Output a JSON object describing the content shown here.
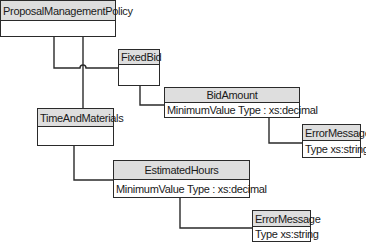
{
  "diagram": {
    "nodes": {
      "policy": {
        "title": "ProposalManagementPolicy",
        "attribute": ""
      },
      "fixed_bid": {
        "title": "FixedBid",
        "attribute": ""
      },
      "bid_amount": {
        "title": "BidAmount",
        "attribute": "MinimumValue Type : xs:decimal"
      },
      "error_message_1": {
        "title": "ErrorMessage",
        "attribute": "Type xs:string"
      },
      "time_and_materials": {
        "title": "TimeAndMaterials",
        "attribute": ""
      },
      "estimated_hours": {
        "title": "EstimatedHours",
        "attribute": "MinimumValue Type : xs:decimal"
      },
      "error_message_2": {
        "title": "ErrorMessage",
        "attribute": "Type xs:string"
      }
    },
    "edges": [
      {
        "from": "ProposalManagementPolicy",
        "to": "FixedBid"
      },
      {
        "from": "ProposalManagementPolicy",
        "to": "TimeAndMaterials"
      },
      {
        "from": "FixedBid",
        "to": "BidAmount"
      },
      {
        "from": "BidAmount",
        "to": "ErrorMessage"
      },
      {
        "from": "TimeAndMaterials",
        "to": "EstimatedHours"
      },
      {
        "from": "EstimatedHours",
        "to": "ErrorMessage"
      }
    ],
    "colors": {
      "header_fill": "#dedede",
      "line": "#2a2a2a",
      "background": "#ffffff"
    }
  }
}
